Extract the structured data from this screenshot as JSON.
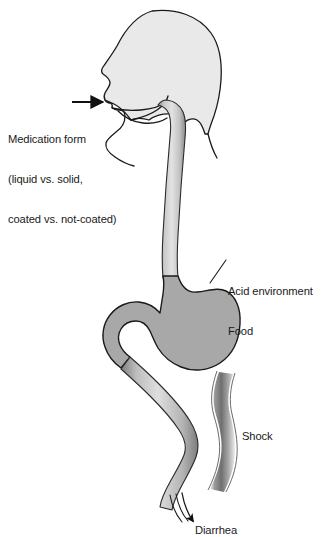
{
  "figure": {
    "type": "anatomical-diagram",
    "background_color": "#ffffff",
    "outline_color": "#1a1a1a",
    "head_fill_color": "#e9e9e9",
    "stomach_fill_color": "#a8a8a8",
    "tract_fill_color": "#b5b5b5",
    "text_color": "#1a1a1a"
  },
  "annotations": {
    "medication_form": {
      "name": "medication-form",
      "lines": [
        "Medication form",
        "(liquid vs. solid,",
        "coated vs. not-coated)"
      ],
      "line1": "Medication form",
      "line2": "(liquid vs. solid,",
      "line3": "coated vs. not-coated)",
      "points_to": "mouth",
      "pointer": "straight-arrow"
    },
    "acid_food": {
      "name": "acid-environment-food",
      "lines": [
        "Acid environment",
        "Food"
      ],
      "line1": "Acid environment",
      "line2": "Food",
      "points_to": "stomach",
      "pointer": "leader-line"
    },
    "shock": {
      "name": "shock",
      "lines": [
        "Shock"
      ],
      "line1": "Shock",
      "points_to": "small-intestine",
      "pointer": "wavy-band"
    },
    "diarrhea": {
      "name": "diarrhea",
      "lines": [
        "Diarrhea"
      ],
      "line1": "Diarrhea",
      "points_to": "tract-outflow",
      "pointer": "curved-arrow"
    }
  },
  "anatomy_parts": [
    {
      "name": "head",
      "label": "head-silhouette"
    },
    {
      "name": "mouth",
      "label": "mouth-and-lips"
    },
    {
      "name": "tongue",
      "label": "tongue"
    },
    {
      "name": "jaw",
      "label": "jaw-and-chin"
    },
    {
      "name": "pharynx",
      "label": "pharynx"
    },
    {
      "name": "esophagus",
      "label": "esophagus"
    },
    {
      "name": "stomach",
      "label": "stomach"
    },
    {
      "name": "duodenum",
      "label": "duodenum"
    },
    {
      "name": "small_intestine",
      "label": "small-intestine"
    }
  ]
}
